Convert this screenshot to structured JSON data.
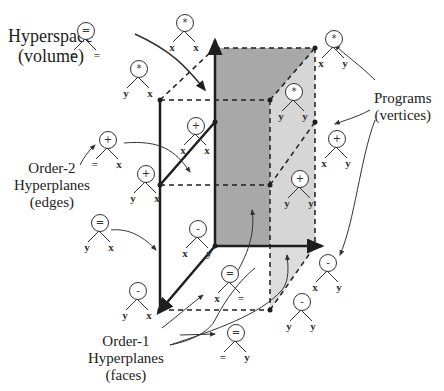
{
  "labels": {
    "hyperspace": [
      "Hyperspace",
      "(volume)"
    ],
    "programs": [
      "Programs",
      "(vertices)"
    ],
    "order2": [
      "Order-2",
      "Hyperplanes",
      "(edges)"
    ],
    "order1": [
      "Order-1",
      "Hyperplanes",
      "(faces)"
    ]
  },
  "trees": [
    {
      "id": "hyperspace-tree",
      "op": "=",
      "left": "=",
      "right": "=",
      "x": 68,
      "y": 22
    },
    {
      "id": "vertex-top-back-left",
      "op": "*",
      "left": "x",
      "right": "x",
      "x": 167,
      "y": 14
    },
    {
      "id": "vertex-top-front-left",
      "op": "*",
      "left": "y",
      "right": "x",
      "x": 121,
      "y": 60
    },
    {
      "id": "vertex-top-back-right",
      "op": "*",
      "left": "x",
      "right": "y",
      "x": 316,
      "y": 30
    },
    {
      "id": "vertex-top-front-right",
      "op": "*",
      "left": "y",
      "right": "y",
      "x": 276,
      "y": 83
    },
    {
      "id": "vertex-mid-back-left",
      "op": "+",
      "left": "x",
      "right": "x",
      "x": 178,
      "y": 117
    },
    {
      "id": "vertex-mid-front-left",
      "op": "+",
      "left": "y",
      "right": "x",
      "x": 128,
      "y": 165
    },
    {
      "id": "edge-upper",
      "op": "+",
      "left": "=",
      "right": "x",
      "x": 90,
      "y": 131
    },
    {
      "id": "vertex-mid-back-right",
      "op": "+",
      "left": "x",
      "right": "y",
      "x": 319,
      "y": 130
    },
    {
      "id": "vertex-mid-front-right",
      "op": "+",
      "left": "y",
      "right": "y",
      "x": 282,
      "y": 170
    },
    {
      "id": "edge-lower",
      "op": "=",
      "left": "y",
      "right": "x",
      "x": 82,
      "y": 214
    },
    {
      "id": "vertex-bottom-back-left",
      "op": "-",
      "left": "x",
      "right": "y",
      "x": 180,
      "y": 220
    },
    {
      "id": "vertex-bottom-front-left",
      "op": "-",
      "left": "y",
      "right": "x",
      "x": 120,
      "y": 282
    },
    {
      "id": "face-bottom",
      "op": "=",
      "left": "x",
      "right": "=",
      "x": 212,
      "y": 265
    },
    {
      "id": "vertex-bottom-back-right",
      "op": "-",
      "left": "x",
      "right": "y",
      "x": 310,
      "y": 254
    },
    {
      "id": "vertex-bottom-front-right",
      "op": "-",
      "left": "y",
      "right": "y",
      "x": 284,
      "y": 293
    },
    {
      "id": "face-side",
      "op": "=",
      "left": "=",
      "right": "y",
      "x": 218,
      "y": 324
    }
  ],
  "colors": {
    "back_face": "#a8a8a8",
    "side_face": "#d4d4d4",
    "line": "#1e1e1e"
  }
}
